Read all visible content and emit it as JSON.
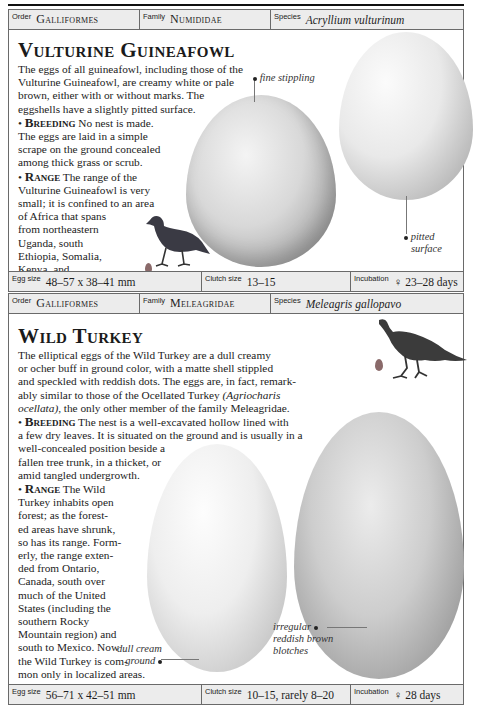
{
  "page": {
    "entries": [
      {
        "order_label": "Order",
        "order": "Galliformes",
        "family_label": "Family",
        "family": "Numididae",
        "species_label": "Species",
        "species": "Acryllium vulturinum",
        "title": "Vulturine Guineafowl",
        "intro_lines": [
          "The eggs of all guineafowl, including those of the",
          "Vulturine Guineafowl, are creamy white or pale",
          "brown, either with or without marks. The",
          "eggshells have a slightly pitted surface."
        ],
        "breeding_heading": "Breeding",
        "breeding_lines": [
          "No nest is made.",
          "The eggs are laid in a simple",
          "scrape on the ground concealed",
          "among thick grass or scrub."
        ],
        "range_heading": "Range",
        "range_lines": [
          "The range of the",
          "Vulturine Guineafowl is very",
          "small; it is confined to an area",
          "of Africa that spans",
          "from northeastern",
          "Uganda, south",
          "Ethiopia, Somalia,",
          "Kenya, and",
          "northern Tanzania."
        ],
        "annotations": [
          "fine stippling",
          "pitted",
          "surface"
        ],
        "egg_size_label": "Egg size",
        "egg_size": "48–57 x 38–41 mm",
        "clutch_label": "Clutch size",
        "clutch": "13–15",
        "incubation_label": "Incubation",
        "incubation": "♀ 23–28 days"
      },
      {
        "order_label": "Order",
        "order": "Galliformes",
        "family_label": "Family",
        "family": "Meleagridae",
        "species_label": "Species",
        "species": "Meleagris gallopavo",
        "title": "Wild Turkey",
        "intro_lines": [
          "The elliptical eggs of the Wild Turkey are a dull creamy",
          "or ocher buff in ground color, with a matte shell stippled",
          "and speckled with reddish dots. The eggs are, in fact, remark-",
          "ably similar to those of the Ocellated Turkey ",
          "(Agriocharis",
          "ocellata)",
          ", the only other member of the family Meleagridae."
        ],
        "breeding_heading": "Breeding",
        "breeding_lines": [
          "The nest is a well-excavated hollow lined with",
          "a few dry leaves. It is situated on the ground and is usually in a",
          "well-concealed position beside a",
          "fallen tree trunk, in a thicket, or",
          "amid tangled undergrowth."
        ],
        "range_heading": "Range",
        "range_lines": [
          "The Wild",
          "Turkey inhabits open",
          "forest; as the forest-",
          "ed areas have shrunk,",
          "so has its range. Form-",
          "erly, the range exten-",
          "ded from Ontario,",
          "Canada, south over",
          "much of the United",
          "States (including the",
          "southern Rocky",
          "Mountain region) and",
          "south to Mexico. Now",
          "the Wild Turkey is com-",
          "mon only in localized areas."
        ],
        "annotations": [
          "dull cream",
          "ground",
          "irregular",
          "reddish brown",
          "blotches"
        ],
        "egg_size_label": "Egg size",
        "egg_size": "56–71 x 42–51 mm",
        "clutch_label": "Clutch size",
        "clutch": "10–15, rarely 8–20",
        "incubation_label": "Incubation",
        "incubation": "♀ 28 days"
      }
    ]
  },
  "colors": {
    "frame": "#6a6a6a",
    "bar": "#ececec",
    "text": "#1e1e1e",
    "egg_scale_dot": "#8a6a6a"
  }
}
